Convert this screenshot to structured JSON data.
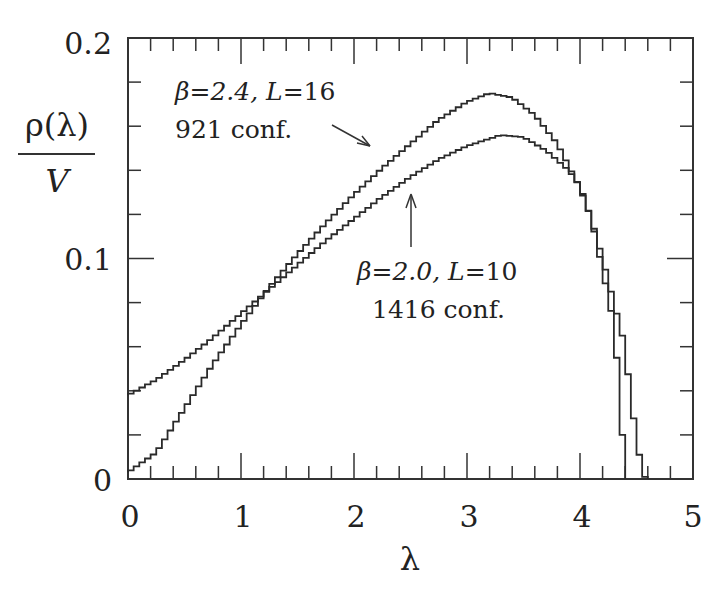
{
  "chart_data": {
    "type": "line",
    "style": "step-histogram",
    "title": "",
    "xlabel": "λ",
    "ylabel": "ρ(λ) / V",
    "ylabel_numerator": "ρ(λ)",
    "ylabel_denominator": "V",
    "xlim": [
      0,
      5
    ],
    "ylim": [
      0,
      0.2
    ],
    "x_ticks": [
      "0",
      "1",
      "2",
      "3",
      "4",
      "5"
    ],
    "y_ticks": [
      "0",
      "0.1",
      "0.2"
    ],
    "x_minor_step": 0.2,
    "y_minor_step": 0.02,
    "grid": false,
    "bin_width": 0.05,
    "series": [
      {
        "name": "β=2.4, L=16 (921 conf.)",
        "label_line1_beta": "β=2.4, ",
        "label_line1_L": "L",
        "label_line1_val": "=16",
        "label_line2": "921 conf.",
        "x": [
          0,
          0.25,
          0.5,
          0.75,
          1.0,
          1.25,
          1.5,
          1.75,
          2.0,
          2.25,
          2.5,
          2.75,
          3.0,
          3.2,
          3.4,
          3.6,
          3.8,
          4.0,
          4.1,
          4.2,
          4.3,
          4.4,
          4.45,
          4.5,
          4.55,
          4.6
        ],
        "y": [
          0.003,
          0.012,
          0.032,
          0.052,
          0.07,
          0.087,
          0.102,
          0.116,
          0.129,
          0.141,
          0.152,
          0.163,
          0.171,
          0.175,
          0.173,
          0.165,
          0.152,
          0.132,
          0.118,
          0.1,
          0.08,
          0.06,
          0.035,
          0.02,
          0.002,
          0.0
        ]
      },
      {
        "name": "β=2.0, L=10 (1416 conf.)",
        "label_line1_beta": "β=2.0, ",
        "label_line1_L": "L",
        "label_line1_val": "=10",
        "label_line2": "1416 conf.",
        "x": [
          0,
          0.25,
          0.5,
          0.75,
          1.0,
          1.25,
          1.5,
          1.75,
          2.0,
          2.25,
          2.5,
          2.75,
          3.0,
          3.3,
          3.5,
          3.7,
          3.9,
          4.0,
          4.1,
          4.2,
          4.3,
          4.35,
          4.4
        ],
        "y": [
          0.038,
          0.045,
          0.054,
          0.064,
          0.075,
          0.086,
          0.097,
          0.108,
          0.118,
          0.128,
          0.137,
          0.145,
          0.151,
          0.156,
          0.155,
          0.149,
          0.14,
          0.133,
          0.118,
          0.095,
          0.07,
          0.04,
          0.0
        ]
      }
    ],
    "annotations": [
      {
        "text": "β=2.4, L=16 / 921 conf.",
        "arrow_to": [
          2.2,
          0.148
        ]
      },
      {
        "text": "β=2.0, L=10 / 1416 conf.",
        "arrow_to": [
          2.48,
          0.143
        ]
      }
    ]
  }
}
